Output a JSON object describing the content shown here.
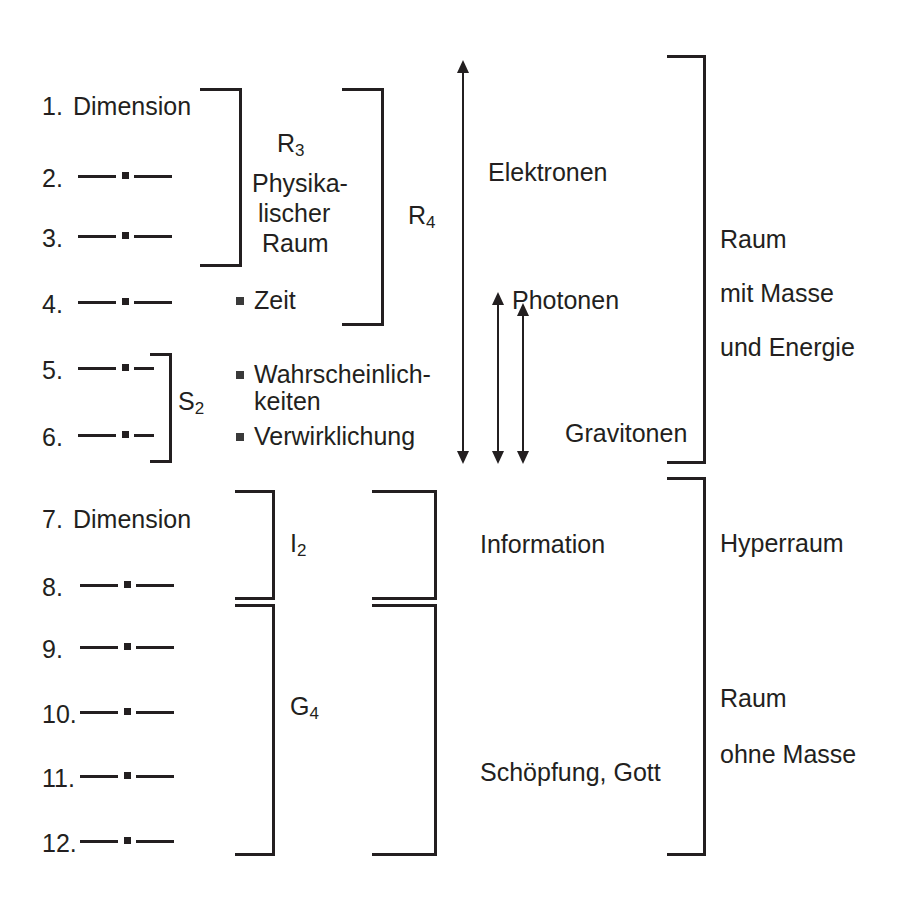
{
  "diagram": {
    "title_text": "",
    "accent_color": "#231f20",
    "background": "#ffffff",
    "left_column": {
      "label": "Dimensionen",
      "rows": [
        {
          "index": "1.",
          "text": "Dimension",
          "line": false
        },
        {
          "index": "2.",
          "text": "",
          "line": true
        },
        {
          "index": "3.",
          "text": "",
          "line": true
        },
        {
          "index": "4.",
          "text": "",
          "line": true
        },
        {
          "index": "5.",
          "text": "",
          "line": true
        },
        {
          "index": "6.",
          "text": "",
          "line": true
        },
        {
          "index": "7.",
          "text": "Dimension",
          "line": false
        },
        {
          "index": "8.",
          "text": "",
          "line": true
        },
        {
          "index": "9.",
          "text": "",
          "line": true
        },
        {
          "index": "10.",
          "text": "",
          "line": true
        },
        {
          "index": "11.",
          "text": "",
          "line": true
        },
        {
          "index": "12.",
          "text": "",
          "line": true
        }
      ]
    },
    "group_labels": {
      "r3": {
        "base": "R",
        "sub": "3"
      },
      "r4": {
        "base": "R",
        "sub": "4"
      },
      "s2": {
        "base": "S",
        "sub": "2"
      },
      "i2": {
        "base": "I",
        "sub": "2"
      },
      "g4": {
        "base": "G",
        "sub": "4"
      }
    },
    "middle_column": {
      "physical_space": [
        "Physika-",
        "lischer",
        "Raum"
      ],
      "bullets": [
        {
          "label": "Zeit"
        },
        {
          "label": "Wahrscheinlich-",
          "label2": "keiten"
        },
        {
          "label": "Verwirklichung"
        }
      ]
    },
    "arrow_column": {
      "arrows": [
        {
          "name": "Elektronen",
          "label": "Elektronen"
        },
        {
          "name": "Photonen",
          "label": "Photonen"
        },
        {
          "name": "Gravitonen",
          "label": "Gravitonen"
        }
      ],
      "lower_labels": [
        "Information",
        "Schöpfung, Gott"
      ]
    },
    "right_column": {
      "upper": [
        "Raum",
        "mit Masse",
        "und Energie"
      ],
      "middle": [
        "Hyperraum"
      ],
      "lower": [
        "Raum",
        "ohne Masse"
      ]
    }
  }
}
